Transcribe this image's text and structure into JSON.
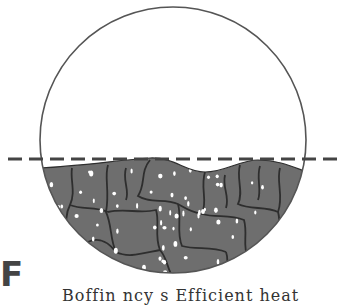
{
  "figure": {
    "panel_label": "F",
    "caption_partial": "Boffin     ncy  s       Efficient heat",
    "colors": {
      "outline": "#555555",
      "fill": "#6e6e6e",
      "cell_border": "#2e2e2e",
      "speck": "#ffffff",
      "dash": "#444444"
    },
    "elements": {
      "vessel": "circular container",
      "level_line": "dashed reference level",
      "contents": "granular cellular material with white specks"
    }
  }
}
